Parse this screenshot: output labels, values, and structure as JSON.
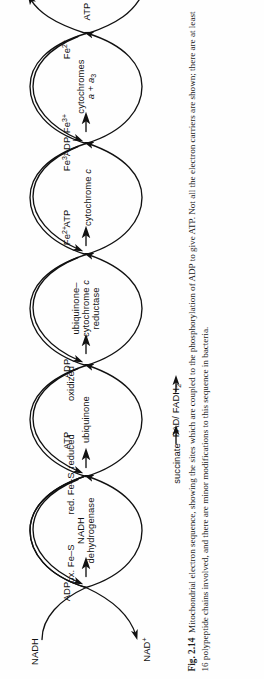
{
  "figure": {
    "number": "Fig. 2.14",
    "caption": "Mitochondrial electron sequence, showing the sites which are coupled to the phosphorylation of ADP to give ATP. Not all the electron carriers are shown; there are at least 16 polypeptide chains involved, and there are minor modifications to this sequence in bacteria.",
    "orientation": "rotated-90-ccw",
    "ink_color": "#111111",
    "page_color": "#fefefe"
  },
  "diagram": {
    "type": "electron-transport-chain",
    "inputs": {
      "nadh": "NADH",
      "nad_plus": "NAD+",
      "succinate": "succinate",
      "fad_fadh2": "FAD/FADH2",
      "half_o2": "O2",
      "half_o2_numerator": "1",
      "half_o2_denominator": "2",
      "water": "H2O"
    },
    "loops": [
      {
        "id": "nadh-dehydrogenase",
        "name_line1": "NADH",
        "name_line2": "dehydrogenase",
        "left_state": "ox. Fe–S",
        "right_state": "red. Fe–S",
        "coupled": true,
        "adp": "ADP",
        "atp": "ATP"
      },
      {
        "id": "ubiquinone",
        "name_line1": "ubiquinone",
        "name_line2": "",
        "left_state": "reduced",
        "right_state": "oxidized",
        "coupled": false,
        "adp": "",
        "atp": ""
      },
      {
        "id": "ubiquinone-cytochrome-c-reductase",
        "name_line1": "ubiquinone–",
        "name_line2": "cytochrome c",
        "name_line3": "reductase",
        "left_state": "",
        "right_state": "",
        "coupled": true,
        "adp": "ADP",
        "atp": "ATP"
      },
      {
        "id": "cytochrome-c",
        "name_line1": "cytochrome c",
        "name_line2": "",
        "left_state": "Fe2+",
        "right_state": "Fe3+",
        "coupled": false,
        "adp": "",
        "atp": ""
      },
      {
        "id": "cytochromes-a-a3",
        "name_line1": "cytochromes",
        "name_line2": "a + a3",
        "left_state": "Fe3+",
        "right_state": "Fe2+",
        "coupled": true,
        "adp": "ADP",
        "atp": "ATP"
      }
    ],
    "labels": {
      "fe2plus_base": "Fe",
      "fe2plus_sup": "2+",
      "fe3plus_sup": "3+",
      "ox_fe_s": "ox. Fe–S",
      "red_fe_s": "red. Fe–S",
      "reduced": "reduced",
      "oxidized": "oxidized",
      "cyt_c": "cytochrome",
      "cyt_c_ital": "c",
      "ubi_dash": "ubiquinone–",
      "cytc_red_mid": "cytochrome",
      "reductase": "reductase",
      "cytochromes": "cytochromes",
      "a_plus_a3_a": "a",
      "a_plus_a3_plus": " + ",
      "a_plus_a3_a3": "a",
      "a3_sub": "3",
      "nadh_dh_1": "NADH",
      "nadh_dh_2": "dehydrogenase",
      "ubiquinone": "ubiquinone",
      "nadh": "NADH",
      "nad": "NAD",
      "nad_sup": "+",
      "succinate": "succinate",
      "fad": "FAD/ FADH",
      "fad_sub": "2",
      "h2o_h": "H",
      "h2o_sub": "2",
      "h2o_o": "O",
      "o2_o": "O",
      "o2_sub": "2",
      "adp": "ADP",
      "atp": "ATP"
    }
  }
}
